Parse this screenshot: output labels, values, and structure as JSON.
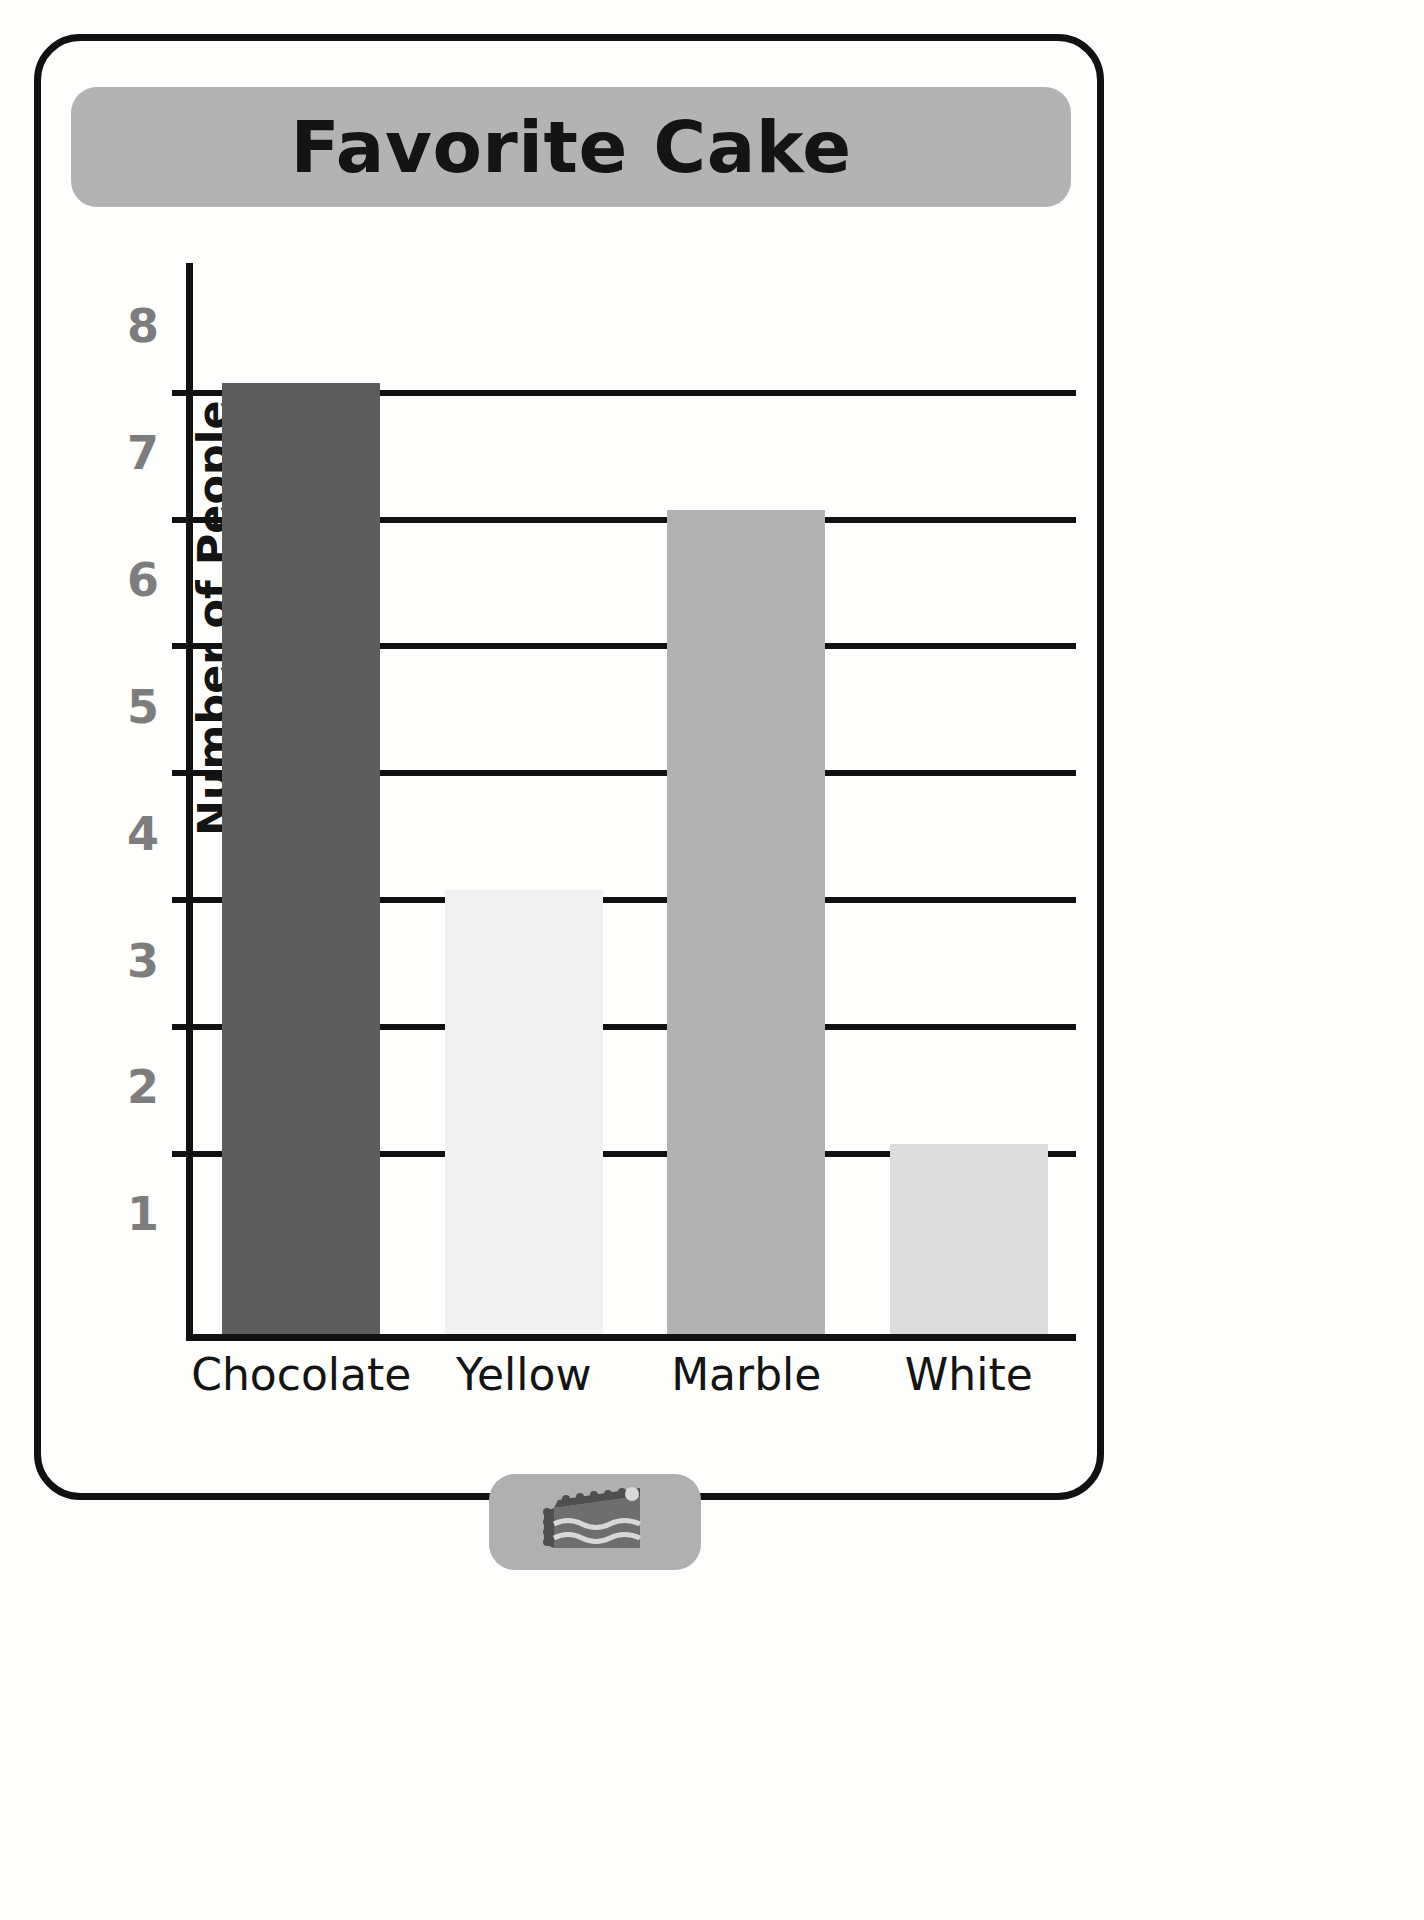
{
  "worksheet": {
    "title": "Favorite Cake",
    "footer_icon": "cake-slice-icon"
  },
  "chart_data": {
    "type": "bar",
    "title": "Favorite Cake",
    "xlabel": "",
    "ylabel": "Number of People",
    "categories": [
      "Chocolate",
      "Yellow",
      "Marble",
      "White"
    ],
    "values": [
      8,
      4,
      7,
      2
    ],
    "ytick_labels": [
      "1",
      "2",
      "3",
      "4",
      "5",
      "6",
      "7",
      "8"
    ],
    "ylim": [
      0,
      8.5
    ],
    "grid": true,
    "legend": "none",
    "bar_colors": [
      "#5d5d5d",
      "#f0f0f0",
      "#b2b2b2",
      "#dcdcdc"
    ]
  },
  "colors": {
    "banner": "#b3b3b3",
    "axis": "#111111",
    "ylabel_text": "#7d7d7d",
    "card_border": "#111111",
    "page_background": "#fdfdfb"
  }
}
